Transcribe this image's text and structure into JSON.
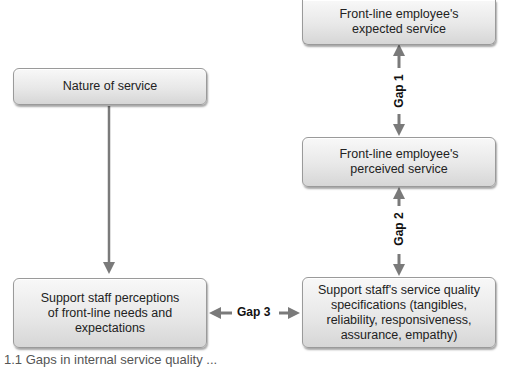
{
  "diagram": {
    "boxes": {
      "expected_service": "Front-line employee's\nexpected service",
      "nature_of_service": "Nature of service",
      "perceived_service": "Front-line employee's\nperceived service",
      "support_perceptions": "Support staff perceptions\nof front-line needs and\nexpectations",
      "quality_specifications": "Support staff's service quality\nspecifications (tangibles,\nreliability, responsiveness,\nassurance, empathy)"
    },
    "gaps": {
      "gap1": "Gap 1",
      "gap2": "Gap 2",
      "gap3": "Gap 3"
    },
    "arrow_color": "#7a7a7a",
    "caption": "1.1  Gaps in internal service quality ..."
  }
}
